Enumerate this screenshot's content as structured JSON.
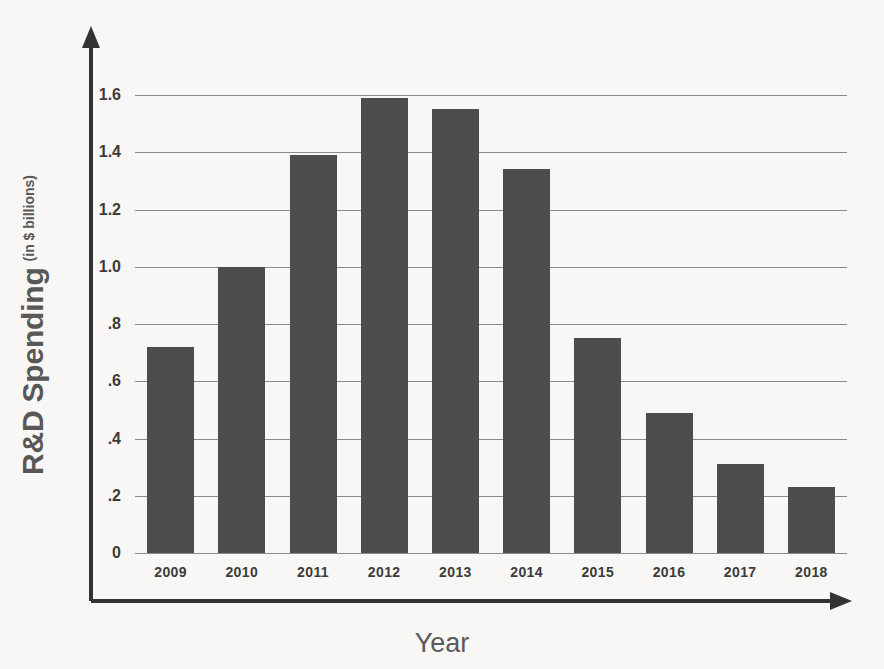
{
  "chart_data": {
    "type": "bar",
    "title": "",
    "xlabel": "Year",
    "ylabel": "R&D Spending",
    "ylabel_main": "R&D Spending",
    "ylabel_sub": "(in $ billions)",
    "categories": [
      "2009",
      "2010",
      "2011",
      "2012",
      "2013",
      "2014",
      "2015",
      "2016",
      "2017",
      "2018"
    ],
    "values": [
      0.72,
      1.0,
      1.39,
      1.59,
      1.55,
      1.34,
      0.75,
      0.49,
      0.31,
      0.23
    ],
    "ylim": [
      0,
      1.6
    ],
    "ytick_values": [
      0,
      0.2,
      0.4,
      0.6,
      0.8,
      1.0,
      1.2,
      1.4,
      1.6
    ],
    "ytick_labels": [
      "0",
      ".2",
      ".4",
      ".6",
      ".8",
      "1.0",
      "1.2",
      "1.4",
      "1.6"
    ],
    "grid": true,
    "legend": "none",
    "bar_color": "#4d4d4d",
    "gridline_color": "#8a8a8a",
    "axis_color": "#333333",
    "background_color": "#f8f7f5"
  }
}
